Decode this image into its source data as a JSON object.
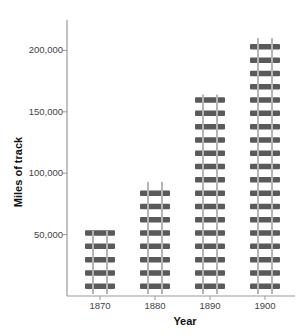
{
  "chart_data": {
    "type": "bar",
    "title": "",
    "xlabel": "Year",
    "ylabel": "Miles of track",
    "categories": [
      "1870",
      "1880",
      "1890",
      "1900"
    ],
    "values": [
      53000,
      93000,
      164000,
      210000
    ],
    "ylim": [
      0,
      225000
    ],
    "yticks": [
      50000,
      100000,
      150000,
      200000
    ],
    "ytick_labels": [
      "50,000",
      "100,000",
      "150,000",
      "200,000"
    ],
    "grid": false,
    "legend": null,
    "bar_style": "railroad-track pictograph"
  },
  "colors": {
    "tie": "#5a5a5a",
    "rail": "#b5b5b5",
    "axis": "#999999"
  }
}
